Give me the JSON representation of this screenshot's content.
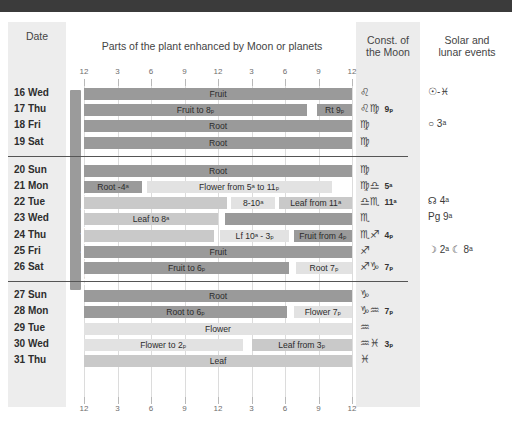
{
  "header": {
    "date_label": "Date",
    "parts_label": "Parts of the plant enhanced by Moon or planets",
    "const_label": "Const. of\nthe Moon",
    "const_label_l1": "Const. of",
    "const_label_l2": "the Moon",
    "events_label": "Solar and\nlunar events",
    "events_label_l1": "Solar and",
    "events_label_l2": "lunar events"
  },
  "side_label": "Transplanting Time",
  "axis": {
    "ticks": [
      "12",
      "3",
      "6",
      "9",
      "12",
      "3",
      "6",
      "9",
      "12"
    ]
  },
  "colors": {
    "dark_bar": "#9a9a9a",
    "mid_bar": "#c9c9c9",
    "light_bar": "#e2e2e2",
    "column_shade": "#ededed",
    "grid_line": "#dcdcdc",
    "top_band": "#3b3b3b"
  },
  "chart_data": {
    "type": "table",
    "title": "Parts of the plant enhanced by Moon or planets",
    "xlabel": "Time of day (12 - 3 - 6 - 9 - 12 - 3 - 6 - 9 - 12)",
    "x_ticks": [
      "12",
      "3",
      "6",
      "9",
      "12",
      "3",
      "6",
      "9",
      "12"
    ],
    "xlim": [
      0,
      24
    ],
    "grid": true,
    "rows": [
      {
        "date": "16 Wed",
        "segments": [
          {
            "label": "Fruit",
            "start": 0,
            "end": 24,
            "tone": "dark"
          }
        ],
        "constellation": "♌",
        "const_time": "",
        "events": "☉-♓"
      },
      {
        "date": "17 Thu",
        "segments": [
          {
            "label": "Fruit to 8ₚ",
            "start": 0,
            "end": 20,
            "tone": "dark"
          },
          {
            "label": "",
            "start": 20,
            "end": 20.9,
            "tone": "blank"
          },
          {
            "label": "Rt 9ₚ",
            "start": 20.9,
            "end": 24,
            "tone": "dark"
          }
        ],
        "constellation": "♌♍",
        "const_time": "9ₚ",
        "events": ""
      },
      {
        "date": "18 Fri",
        "segments": [
          {
            "label": "Root",
            "start": 0,
            "end": 24,
            "tone": "dark"
          }
        ],
        "constellation": "♍",
        "const_time": "",
        "events": "○ 3ᵃ"
      },
      {
        "date": "19 Sat",
        "segments": [
          {
            "label": "Root",
            "start": 0,
            "end": 24,
            "tone": "dark"
          }
        ],
        "constellation": "♍",
        "const_time": "",
        "events": ""
      },
      {
        "date": "20 Sun",
        "segments": [
          {
            "label": "Root",
            "start": 0,
            "end": 24,
            "tone": "dark"
          }
        ],
        "constellation": "♍",
        "const_time": "",
        "events": ""
      },
      {
        "date": "21 Mon",
        "segments": [
          {
            "label": "Root -4ᵃ",
            "start": 0,
            "end": 5.2,
            "tone": "dark"
          },
          {
            "label": "Flower from 5ᵃ to 11ₚ",
            "start": 5.6,
            "end": 22.2,
            "tone": "light"
          }
        ],
        "constellation": "♍♎",
        "const_time": "5ᵃ",
        "events": ""
      },
      {
        "date": "22 Tue",
        "segments": [
          {
            "label": "",
            "start": 0,
            "end": 12.8,
            "tone": "mid"
          },
          {
            "label": "8-10ᵃ",
            "start": 13.2,
            "end": 17.1,
            "tone": "light"
          },
          {
            "label": "Leaf from 11ᵃ",
            "start": 17.5,
            "end": 24,
            "tone": "mid"
          }
        ],
        "constellation": "♎♏",
        "const_time": "11ᵃ",
        "events": "☊ 4ᵃ"
      },
      {
        "date": "23 Wed",
        "segments": [
          {
            "label": "Leaf to 8ᵃ",
            "start": 0,
            "end": 12.0,
            "tone": "mid"
          },
          {
            "label": "",
            "start": 12.6,
            "end": 24,
            "tone": "dark"
          }
        ],
        "constellation": "♏",
        "const_time": "",
        "events": "Pg 9ᵃ"
      },
      {
        "date": "24 Thu",
        "segments": [
          {
            "label": "",
            "start": 0,
            "end": 11.6,
            "tone": "mid"
          },
          {
            "label": "Lf 10ᵃ - 3ₚ",
            "start": 12.2,
            "end": 18.4,
            "tone": "light"
          },
          {
            "label": "Fruit from 4ₚ",
            "start": 18.8,
            "end": 24,
            "tone": "dark"
          }
        ],
        "constellation": "♏♐",
        "const_time": "4ₚ",
        "events": ""
      },
      {
        "date": "25 Fri",
        "segments": [
          {
            "label": "Fruit",
            "start": 0,
            "end": 24,
            "tone": "dark"
          }
        ],
        "constellation": "♐",
        "const_time": "",
        "events": "☽ 2ᵃ   ☾ 8ᵃ"
      },
      {
        "date": "26 Sat",
        "segments": [
          {
            "label": "Fruit to 6ₚ",
            "start": 0,
            "end": 18.4,
            "tone": "dark"
          },
          {
            "label": "Root 7ₚ",
            "start": 19.0,
            "end": 24,
            "tone": "light"
          }
        ],
        "constellation": "♐♑",
        "const_time": "7ₚ",
        "events": ""
      },
      {
        "date": "27 Sun",
        "segments": [
          {
            "label": "Root",
            "start": 0,
            "end": 24,
            "tone": "dark"
          }
        ],
        "constellation": "♑",
        "const_time": "",
        "events": ""
      },
      {
        "date": "28 Mon",
        "segments": [
          {
            "label": "Root to 6ₚ",
            "start": 0,
            "end": 18.2,
            "tone": "dark"
          },
          {
            "label": "Flower 7ₚ",
            "start": 18.8,
            "end": 24,
            "tone": "light"
          }
        ],
        "constellation": "♑♒",
        "const_time": "7ₚ",
        "events": ""
      },
      {
        "date": "29 Tue",
        "segments": [
          {
            "label": "Flower",
            "start": 0,
            "end": 24,
            "tone": "light"
          }
        ],
        "constellation": "♒",
        "const_time": "",
        "events": ""
      },
      {
        "date": "30 Wed",
        "segments": [
          {
            "label": "Flower to 2ₚ",
            "start": 0,
            "end": 14.2,
            "tone": "light"
          },
          {
            "label": "Leaf from 3ₚ",
            "start": 15.0,
            "end": 24,
            "tone": "mid"
          }
        ],
        "constellation": "♒♓",
        "const_time": "3ₚ",
        "events": ""
      },
      {
        "date": "31 Thu",
        "segments": [
          {
            "label": "Leaf",
            "start": 0,
            "end": 24,
            "tone": "mid"
          }
        ],
        "constellation": "♓",
        "const_time": "",
        "events": ""
      }
    ]
  }
}
